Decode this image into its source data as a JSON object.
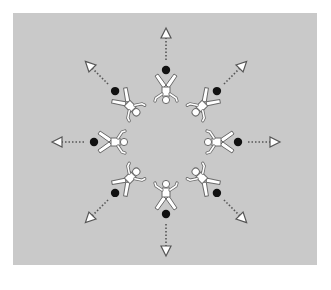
{
  "diagram": {
    "title": "",
    "background_color": "#c9c9c9",
    "page_color": "#ffffff",
    "ball_color": "#111111",
    "figure_fill": "#ffffff",
    "figure_stroke": "#6a6a6a",
    "arrow_color": "#555555",
    "center": [
      166,
      142
    ],
    "players": [
      {
        "id": "N",
        "angle": -90,
        "label": ""
      },
      {
        "id": "NE",
        "angle": -45,
        "label": ""
      },
      {
        "id": "E",
        "angle": 0,
        "label": ""
      },
      {
        "id": "SE",
        "angle": 45,
        "label": ""
      },
      {
        "id": "S",
        "angle": 90,
        "label": ""
      },
      {
        "id": "SW",
        "angle": 135,
        "label": ""
      },
      {
        "id": "W",
        "angle": 180,
        "label": ""
      },
      {
        "id": "NW",
        "angle": -135,
        "label": ""
      }
    ],
    "figure_distance": 52,
    "ball_distance": 72,
    "arrow_start_distance": 82,
    "arrow_end_distance": 114
  }
}
